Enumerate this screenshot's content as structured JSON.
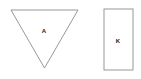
{
  "canvas": {
    "width": 141,
    "height": 79,
    "background_color": "#ffffff"
  },
  "style": {
    "stroke_color": "#8c8c8c",
    "stroke_width": 0.9,
    "fill_color": "none",
    "label_color": "#1a1a1a"
  },
  "shapes": [
    {
      "id": "triangle-a",
      "kind": "triangle",
      "orientation": "point-down",
      "label": "A",
      "label_x": 44,
      "label_y": 31,
      "points": "11,10 78,10 44.5,68",
      "vertices": [
        {
          "x": 11,
          "y": 10
        },
        {
          "x": 78,
          "y": 10
        },
        {
          "x": 44.5,
          "y": 68
        }
      ]
    },
    {
      "id": "rectangle-k",
      "kind": "rectangle",
      "orientation": "portrait",
      "label": "K",
      "label_x": 118,
      "label_y": 41,
      "x": 104,
      "y": 9,
      "width": 29,
      "height": 61
    }
  ]
}
